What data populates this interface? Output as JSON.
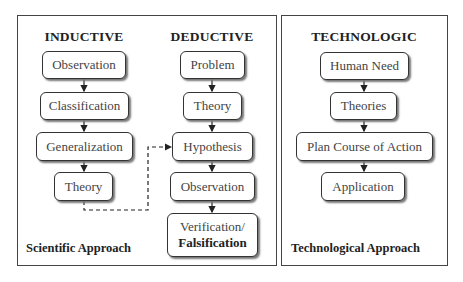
{
  "scientific_panel": {
    "caption": "Scientific Approach",
    "inductive": {
      "heading": "INDUCTIVE",
      "steps": [
        "Observation",
        "Classification",
        "Generalization",
        "Theory"
      ]
    },
    "deductive": {
      "heading": "DEDUCTIVE",
      "steps": [
        "Problem",
        "Theory",
        "Hypothesis",
        "Observation"
      ],
      "final_step": {
        "line1": "Verification/",
        "line2": "Falsification"
      }
    },
    "dashed_link": {
      "from": "inductive.Theory",
      "to": "deductive.Hypothesis"
    }
  },
  "technological_panel": {
    "caption": "Technological Approach",
    "heading": "TECHNOLOGIC",
    "steps": [
      "Human Need",
      "Theories",
      "Plan Course of Action",
      "Application"
    ]
  },
  "colors": {
    "border": "#444444",
    "text": "#444444",
    "heading": "#222222",
    "shadow": "#777777"
  }
}
